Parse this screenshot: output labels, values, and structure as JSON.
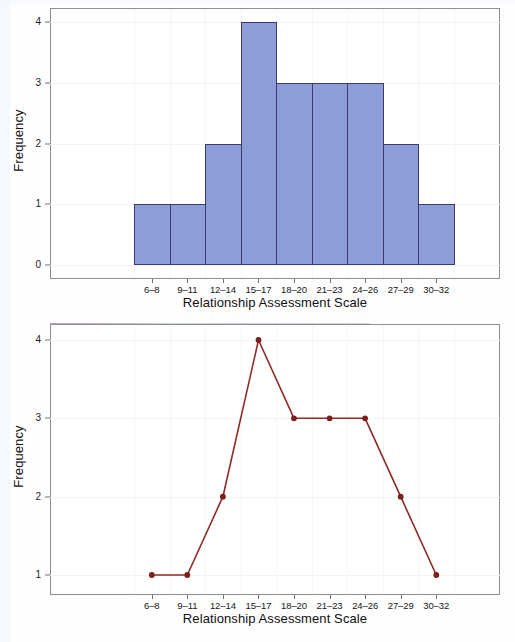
{
  "chart_data": [
    {
      "type": "bar",
      "title": "",
      "xlabel": "Relationship Assessment Scale",
      "ylabel": "Frequency",
      "categories": [
        "6–8",
        "9–11",
        "12–14",
        "15–17",
        "18–20",
        "21–23",
        "24–26",
        "27–29",
        "30–32"
      ],
      "values": [
        1,
        1,
        2,
        4,
        3,
        3,
        3,
        2,
        1
      ],
      "yticks": [
        0,
        1,
        2,
        3,
        4
      ],
      "ylim": [
        0,
        4
      ],
      "grid": true,
      "legend": "none",
      "bar_fill": "#8d9dd8",
      "bar_border": "#3a3a6b"
    },
    {
      "type": "line",
      "title": "",
      "xlabel": "Relationship Assessment Scale",
      "ylabel": "Frequency",
      "categories": [
        "6–8",
        "9–11",
        "12–14",
        "15–17",
        "18–20",
        "21–23",
        "24–26",
        "27–29",
        "30–32"
      ],
      "values": [
        1,
        1,
        2,
        4,
        3,
        3,
        3,
        2,
        1
      ],
      "yticks": [
        1,
        2,
        3,
        4
      ],
      "ylim": [
        1,
        4
      ],
      "grid": true,
      "legend": "none",
      "line_color": "#8f2b25",
      "marker": "circle",
      "marker_color": "#7d1f1c"
    }
  ],
  "top_chart": {
    "ylabel": "Frequency",
    "xlabel": "Relationship Assessment Scale",
    "yticks": [
      "4",
      "3",
      "2",
      "1",
      "0"
    ],
    "xticks": [
      "6–8",
      "9–11",
      "12–14",
      "15–17",
      "18–20",
      "21–23",
      "24–26",
      "27–29",
      "30–32"
    ]
  },
  "bottom_chart": {
    "ylabel": "Frequency",
    "xlabel": "Relationship Assessment Scale",
    "yticks": [
      "4",
      "3",
      "2",
      "1"
    ],
    "xticks": [
      "6–8",
      "9–11",
      "12–14",
      "15–17",
      "18–20",
      "21–23",
      "24–26",
      "27–29",
      "30–32"
    ]
  }
}
